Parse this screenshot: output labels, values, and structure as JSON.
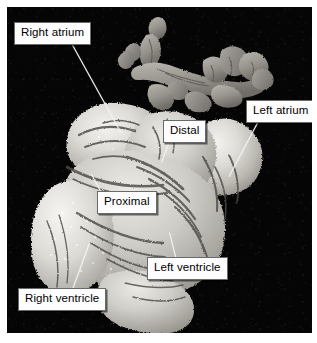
{
  "figure": {
    "kind": "anatomical-photograph",
    "background_color": "#050505",
    "frame_color": "#ffffff",
    "label_box_color": "#fdfdfd",
    "label_border_color": "#6a6a6a",
    "leader_line_color": "#f2f2f2"
  },
  "labels": [
    {
      "id": "right-atrium",
      "text": "Right atrium",
      "box_x": 14,
      "box_y": 22,
      "lx": 72,
      "ly": 44,
      "len": 101,
      "angle": 61
    },
    {
      "id": "left-atrium",
      "text": "Left atrium",
      "box_x": 246,
      "box_y": 100,
      "lx": 258,
      "ly": 121,
      "len": 62,
      "angle": 118
    },
    {
      "id": "distal",
      "text": "Distal",
      "box_x": 163,
      "box_y": 120,
      "lx": 169,
      "ly": 141,
      "len": 22,
      "angle": 110
    },
    {
      "id": "proximal",
      "text": "Proximal",
      "box_x": 97,
      "box_y": 191,
      "lx": 101,
      "ly": 191,
      "len": 20,
      "angle": -118
    },
    {
      "id": "left-ventricle",
      "text": "Left ventricle",
      "box_x": 147,
      "box_y": 257,
      "lx": 176,
      "ly": 257,
      "len": 26,
      "angle": -104
    },
    {
      "id": "right-ventricle",
      "text": "Right ventricle",
      "box_x": 18,
      "box_y": 288,
      "lx": 73,
      "ly": 288,
      "len": 48,
      "angle": -70
    }
  ]
}
